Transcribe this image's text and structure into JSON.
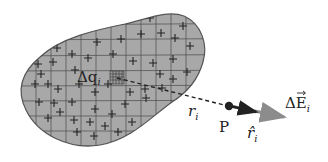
{
  "diagram": {
    "type": "electric field of continuous charge distribution",
    "labels": {
      "charge_element": "Δq",
      "charge_element_sub": "i",
      "distance": "r",
      "distance_sub": "i",
      "point": "P",
      "unit_vector": "r̂",
      "unit_vector_sub": "i",
      "field": "ΔE",
      "field_sub": "i"
    },
    "colors": {
      "blob_fill": "#a8a8a8",
      "blob_stroke": "#555555",
      "grid": "#4a4a4a",
      "plus": "#222222",
      "dashed_line": "#222222",
      "point": "#222222",
      "unit_vector": "#222222",
      "field_vector": "#8c8c8c"
    },
    "plus_sign_count": "many",
    "grid": "rectangular grid overlaying charged region"
  }
}
